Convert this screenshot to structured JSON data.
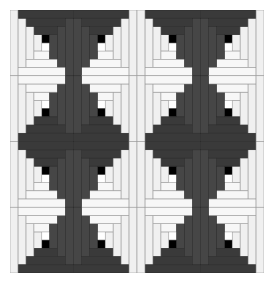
{
  "image": {
    "subject": "Log cabin quilt pattern",
    "grid": {
      "rows": 4,
      "cols": 4
    },
    "colors": {
      "dark": "#464646",
      "darker": "#3a3a3a",
      "light": "#f0f0f0",
      "lighter": "#f7f7f7",
      "center": "#000000",
      "seam": "#2a2a2a",
      "light_seam": "#9a9a9a",
      "background": "#ffffff"
    },
    "blocks": [
      [
        "TR",
        "TL",
        "TR",
        "TL"
      ],
      [
        "BR",
        "BL",
        "BR",
        "BL"
      ],
      [
        "TR",
        "TL",
        "TR",
        "TL"
      ],
      [
        "BR",
        "BL",
        "BR",
        "BL"
      ]
    ]
  }
}
